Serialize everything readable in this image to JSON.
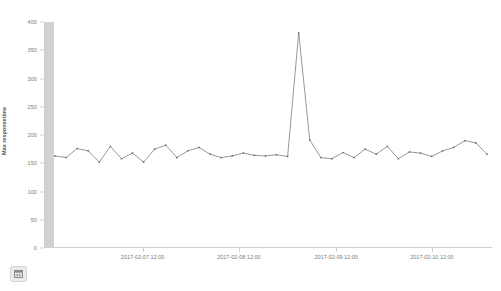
{
  "chart_data": {
    "type": "line",
    "title": "",
    "subtitle": "",
    "xlabel": "@timestamp per 3 hours",
    "ylabel": "Max responsetime",
    "ylim": [
      0,
      400
    ],
    "yticks": [
      0,
      50,
      100,
      150,
      200,
      250,
      300,
      350,
      400
    ],
    "ytick_labels": [
      "0",
      "50",
      "100",
      "150",
      "200",
      "250",
      "300",
      "350",
      "400"
    ],
    "xtick_labels": [
      "2017-02-07 12:00",
      "2017-02-08 12:00",
      "2017-02-09 12:00",
      "2017-02-10 12:00"
    ],
    "xtick_positions_pct": [
      22.0,
      43.5,
      65.2,
      86.6
    ],
    "grid": false,
    "legend": null,
    "line_color": "#6b6b6b",
    "marker": "circle",
    "series": [
      {
        "name": "Max responsetime",
        "values": [
          163,
          160,
          176,
          172,
          152,
          180,
          158,
          168,
          152,
          175,
          182,
          160,
          172,
          178,
          166,
          160,
          163,
          168,
          164,
          163,
          165,
          162,
          381,
          191,
          160,
          158,
          169,
          160,
          175,
          166,
          180,
          158,
          170,
          168,
          162,
          172,
          178,
          190,
          186,
          166
        ]
      }
    ],
    "annotations": [
      {
        "label": "peak",
        "value": 381
      }
    ]
  },
  "footer": {
    "grid_button_label": "table-view"
  }
}
